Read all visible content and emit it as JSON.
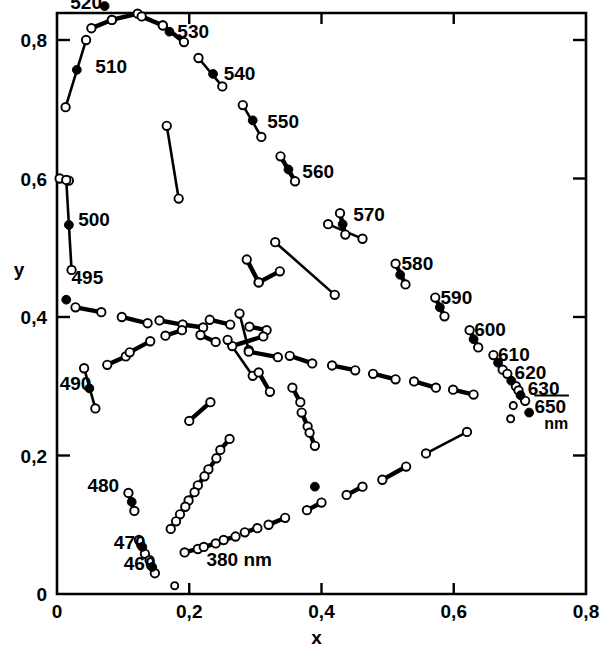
{
  "figure": {
    "background_color": "#ffffff",
    "ink_color": "#000000"
  },
  "axes": {
    "x": {
      "label": "x",
      "ticks": [
        "0",
        "0,2",
        "0,4",
        "0,6",
        "0,8"
      ],
      "tick_values": [
        0,
        0.2,
        0.4,
        0.6,
        0.8
      ],
      "min": 0,
      "max": 0.8
    },
    "y": {
      "label": "y",
      "ticks": [
        "0",
        "0,2",
        "0,4",
        "0,6",
        "0,8"
      ],
      "tick_values": [
        0,
        0.2,
        0.4,
        0.6,
        0.8
      ],
      "min": 0,
      "max": 0.86
    }
  },
  "annotations": {
    "unit_note": "380 nm",
    "unit_suffix": "nm",
    "wavelength_labels": [
      {
        "text": "520",
        "x": 0.068,
        "y": 0.845,
        "anchor": "end"
      },
      {
        "text": "510",
        "x": 0.058,
        "y": 0.752,
        "anchor": "start"
      },
      {
        "text": "530",
        "x": 0.182,
        "y": 0.803,
        "anchor": "start"
      },
      {
        "text": "540",
        "x": 0.252,
        "y": 0.742,
        "anchor": "start"
      },
      {
        "text": "550",
        "x": 0.318,
        "y": 0.673,
        "anchor": "start"
      },
      {
        "text": "560",
        "x": 0.371,
        "y": 0.601,
        "anchor": "start"
      },
      {
        "text": "570",
        "x": 0.448,
        "y": 0.538,
        "anchor": "start"
      },
      {
        "text": "580",
        "x": 0.521,
        "y": 0.468,
        "anchor": "start"
      },
      {
        "text": "590",
        "x": 0.58,
        "y": 0.419,
        "anchor": "start"
      },
      {
        "text": "600",
        "x": 0.631,
        "y": 0.372,
        "anchor": "start"
      },
      {
        "text": "610",
        "x": 0.667,
        "y": 0.337,
        "anchor": "start"
      },
      {
        "text": "620",
        "x": 0.692,
        "y": 0.31,
        "anchor": "start"
      },
      {
        "text": "630",
        "x": 0.712,
        "y": 0.288,
        "anchor": "start"
      },
      {
        "text": "650",
        "x": 0.722,
        "y": 0.262,
        "anchor": "start",
        "overline": true
      },
      {
        "text": "500",
        "x": 0.032,
        "y": 0.531,
        "anchor": "start"
      },
      {
        "text": "495",
        "x": 0.022,
        "y": 0.447,
        "anchor": "start"
      },
      {
        "text": "490",
        "x": 0.004,
        "y": 0.295,
        "anchor": "start"
      },
      {
        "text": "480",
        "x": 0.046,
        "y": 0.147,
        "anchor": "start"
      },
      {
        "text": "470",
        "x": 0.086,
        "y": 0.065,
        "anchor": "start"
      },
      {
        "text": "460",
        "x": 0.101,
        "y": 0.035,
        "anchor": "start"
      }
    ],
    "nm_unit_label": {
      "text": "nm",
      "x": 0.737,
      "y": 0.238
    },
    "note_380": {
      "text": "380 nm",
      "x": 0.226,
      "y": 0.04
    }
  },
  "chart_data": {
    "type": "scatter",
    "xlabel": "x",
    "ylabel": "y",
    "xlim": [
      0,
      0.8
    ],
    "ylim": [
      0,
      0.86
    ],
    "grid": false,
    "legend": null,
    "segments": [
      {
        "x1": 0.013,
        "y1": 0.703,
        "x2": 0.044,
        "y2": 0.8
      },
      {
        "x1": 0.052,
        "y1": 0.817,
        "x2": 0.083,
        "y2": 0.829
      },
      {
        "x1": 0.083,
        "y1": 0.829,
        "x2": 0.122,
        "y2": 0.838
      },
      {
        "x1": 0.128,
        "y1": 0.834,
        "x2": 0.16,
        "y2": 0.821
      },
      {
        "x1": 0.16,
        "y1": 0.821,
        "x2": 0.192,
        "y2": 0.797
      },
      {
        "x1": 0.214,
        "y1": 0.774,
        "x2": 0.25,
        "y2": 0.733
      },
      {
        "x1": 0.281,
        "y1": 0.706,
        "x2": 0.309,
        "y2": 0.66
      },
      {
        "x1": 0.338,
        "y1": 0.632,
        "x2": 0.36,
        "y2": 0.596
      },
      {
        "x1": 0.166,
        "y1": 0.676,
        "x2": 0.184,
        "y2": 0.571
      },
      {
        "x1": 0.004,
        "y1": 0.6,
        "x2": 0.018,
        "y2": 0.597
      },
      {
        "x1": 0.014,
        "y1": 0.598,
        "x2": 0.022,
        "y2": 0.468
      },
      {
        "x1": 0.428,
        "y1": 0.55,
        "x2": 0.436,
        "y2": 0.519
      },
      {
        "x1": 0.41,
        "y1": 0.534,
        "x2": 0.462,
        "y2": 0.513
      },
      {
        "x1": 0.33,
        "y1": 0.508,
        "x2": 0.42,
        "y2": 0.432
      },
      {
        "x1": 0.512,
        "y1": 0.477,
        "x2": 0.527,
        "y2": 0.447
      },
      {
        "x1": 0.572,
        "y1": 0.428,
        "x2": 0.586,
        "y2": 0.401
      },
      {
        "x1": 0.624,
        "y1": 0.381,
        "x2": 0.637,
        "y2": 0.356
      },
      {
        "x1": 0.66,
        "y1": 0.345,
        "x2": 0.674,
        "y2": 0.324
      },
      {
        "x1": 0.681,
        "y1": 0.318,
        "x2": 0.694,
        "y2": 0.3
      },
      {
        "x1": 0.698,
        "y1": 0.294,
        "x2": 0.708,
        "y2": 0.279
      },
      {
        "x1": 0.287,
        "y1": 0.483,
        "x2": 0.305,
        "y2": 0.45
      },
      {
        "x1": 0.305,
        "y1": 0.45,
        "x2": 0.337,
        "y2": 0.466
      },
      {
        "x1": 0.028,
        "y1": 0.414,
        "x2": 0.067,
        "y2": 0.407
      },
      {
        "x1": 0.098,
        "y1": 0.4,
        "x2": 0.137,
        "y2": 0.391
      },
      {
        "x1": 0.155,
        "y1": 0.395,
        "x2": 0.19,
        "y2": 0.389
      },
      {
        "x1": 0.19,
        "y1": 0.389,
        "x2": 0.221,
        "y2": 0.385
      },
      {
        "x1": 0.231,
        "y1": 0.396,
        "x2": 0.262,
        "y2": 0.389
      },
      {
        "x1": 0.291,
        "y1": 0.386,
        "x2": 0.317,
        "y2": 0.381
      },
      {
        "x1": 0.041,
        "y1": 0.326,
        "x2": 0.058,
        "y2": 0.268
      },
      {
        "x1": 0.076,
        "y1": 0.331,
        "x2": 0.104,
        "y2": 0.343
      },
      {
        "x1": 0.11,
        "y1": 0.349,
        "x2": 0.141,
        "y2": 0.365
      },
      {
        "x1": 0.164,
        "y1": 0.373,
        "x2": 0.189,
        "y2": 0.381
      },
      {
        "x1": 0.217,
        "y1": 0.374,
        "x2": 0.24,
        "y2": 0.364
      },
      {
        "x1": 0.276,
        "y1": 0.405,
        "x2": 0.29,
        "y2": 0.352
      },
      {
        "x1": 0.265,
        "y1": 0.358,
        "x2": 0.312,
        "y2": 0.372
      },
      {
        "x1": 0.258,
        "y1": 0.367,
        "x2": 0.296,
        "y2": 0.315
      },
      {
        "x1": 0.29,
        "y1": 0.35,
        "x2": 0.334,
        "y2": 0.342
      },
      {
        "x1": 0.352,
        "y1": 0.344,
        "x2": 0.386,
        "y2": 0.333
      },
      {
        "x1": 0.416,
        "y1": 0.33,
        "x2": 0.451,
        "y2": 0.323
      },
      {
        "x1": 0.478,
        "y1": 0.318,
        "x2": 0.512,
        "y2": 0.31
      },
      {
        "x1": 0.54,
        "y1": 0.307,
        "x2": 0.573,
        "y2": 0.298
      },
      {
        "x1": 0.599,
        "y1": 0.295,
        "x2": 0.63,
        "y2": 0.288
      },
      {
        "x1": 0.305,
        "y1": 0.32,
        "x2": 0.322,
        "y2": 0.292
      },
      {
        "x1": 0.356,
        "y1": 0.298,
        "x2": 0.368,
        "y2": 0.277
      },
      {
        "x1": 0.37,
        "y1": 0.262,
        "x2": 0.379,
        "y2": 0.242
      },
      {
        "x1": 0.382,
        "y1": 0.233,
        "x2": 0.39,
        "y2": 0.214
      },
      {
        "x1": 0.2,
        "y1": 0.25,
        "x2": 0.232,
        "y2": 0.277
      },
      {
        "x1": 0.247,
        "y1": 0.208,
        "x2": 0.261,
        "y2": 0.224
      },
      {
        "x1": 0.229,
        "y1": 0.18,
        "x2": 0.241,
        "y2": 0.196
      },
      {
        "x1": 0.213,
        "y1": 0.157,
        "x2": 0.223,
        "y2": 0.17
      },
      {
        "x1": 0.199,
        "y1": 0.135,
        "x2": 0.208,
        "y2": 0.147
      },
      {
        "x1": 0.186,
        "y1": 0.115,
        "x2": 0.194,
        "y2": 0.126
      },
      {
        "x1": 0.172,
        "y1": 0.094,
        "x2": 0.18,
        "y2": 0.105
      },
      {
        "x1": 0.108,
        "y1": 0.146,
        "x2": 0.117,
        "y2": 0.12
      },
      {
        "x1": 0.124,
        "y1": 0.078,
        "x2": 0.133,
        "y2": 0.058
      },
      {
        "x1": 0.14,
        "y1": 0.049,
        "x2": 0.148,
        "y2": 0.03
      },
      {
        "x1": 0.193,
        "y1": 0.06,
        "x2": 0.213,
        "y2": 0.065
      },
      {
        "x1": 0.222,
        "y1": 0.068,
        "x2": 0.24,
        "y2": 0.073
      },
      {
        "x1": 0.252,
        "y1": 0.078,
        "x2": 0.27,
        "y2": 0.083
      },
      {
        "x1": 0.284,
        "y1": 0.089,
        "x2": 0.303,
        "y2": 0.095
      },
      {
        "x1": 0.32,
        "y1": 0.1,
        "x2": 0.345,
        "y2": 0.11
      },
      {
        "x1": 0.378,
        "y1": 0.121,
        "x2": 0.4,
        "y2": 0.132
      },
      {
        "x1": 0.438,
        "y1": 0.143,
        "x2": 0.462,
        "y2": 0.155
      },
      {
        "x1": 0.492,
        "y1": 0.165,
        "x2": 0.528,
        "y2": 0.184
      },
      {
        "x1": 0.558,
        "y1": 0.203,
        "x2": 0.62,
        "y2": 0.234
      }
    ],
    "isolated_points": [
      {
        "x": 0.69,
        "y": 0.272
      },
      {
        "x": 0.686,
        "y": 0.253
      },
      {
        "x": 0.178,
        "y": 0.012
      }
    ],
    "reference_dots": [
      {
        "x": 0.072,
        "y": 0.849,
        "label": "520"
      },
      {
        "x": 0.03,
        "y": 0.757,
        "label": "510"
      },
      {
        "x": 0.17,
        "y": 0.812,
        "label": "530"
      },
      {
        "x": 0.236,
        "y": 0.751,
        "label": "540"
      },
      {
        "x": 0.296,
        "y": 0.684,
        "label": "550"
      },
      {
        "x": 0.35,
        "y": 0.613,
        "label": "560"
      },
      {
        "x": 0.432,
        "y": 0.534,
        "label": "570"
      },
      {
        "x": 0.519,
        "y": 0.461,
        "label": "580"
      },
      {
        "x": 0.579,
        "y": 0.414,
        "label": "590"
      },
      {
        "x": 0.63,
        "y": 0.368,
        "label": "600"
      },
      {
        "x": 0.667,
        "y": 0.334,
        "label": "610"
      },
      {
        "x": 0.687,
        "y": 0.308,
        "label": "620"
      },
      {
        "x": 0.701,
        "y": 0.287,
        "label": "630"
      },
      {
        "x": 0.714,
        "y": 0.262,
        "label": "650"
      },
      {
        "x": 0.018,
        "y": 0.533,
        "label": "500"
      },
      {
        "x": 0.014,
        "y": 0.425,
        "label": "495"
      },
      {
        "x": 0.049,
        "y": 0.297,
        "label": "490"
      },
      {
        "x": 0.113,
        "y": 0.133,
        "label": "480"
      },
      {
        "x": 0.129,
        "y": 0.068,
        "label": "470"
      },
      {
        "x": 0.144,
        "y": 0.039,
        "label": "460"
      },
      {
        "x": 0.39,
        "y": 0.155,
        "label": ""
      }
    ]
  }
}
